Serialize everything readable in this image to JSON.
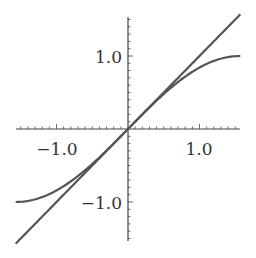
{
  "chart_data": {
    "type": "line",
    "title": "",
    "xlabel": "",
    "ylabel": "",
    "xlim": [
      -1.5708,
      1.5708
    ],
    "ylim": [
      -1.55,
      1.55
    ],
    "grid": false,
    "legend": null,
    "x_ticks": [
      -1.0,
      1.0
    ],
    "x_tick_labels": [
      "−1.0",
      "1.0"
    ],
    "y_ticks": [
      -1.0,
      1.0
    ],
    "y_tick_labels": [
      "−1.0",
      "1.0"
    ],
    "minor_tick_step": 0.1,
    "series": [
      {
        "name": "y = x",
        "function": "x",
        "x": [
          -1.5708,
          -1.0,
          -0.5,
          0,
          0.5,
          1.0,
          1.5708
        ],
        "y": [
          -1.5708,
          -1.0,
          -0.5,
          0,
          0.5,
          1.0,
          1.5708
        ],
        "color": "#555555"
      },
      {
        "name": "y = sin(x)",
        "function": "sin(x)",
        "x": [
          -1.5708,
          -1.0,
          -0.5,
          0,
          0.5,
          1.0,
          1.5708
        ],
        "y": [
          -1.0,
          -0.841,
          -0.479,
          0,
          0.479,
          0.841,
          1.0
        ],
        "color": "#555555"
      }
    ]
  },
  "colors": {
    "axis": "#444444",
    "curve": "#555555",
    "background": "#ffffff"
  }
}
